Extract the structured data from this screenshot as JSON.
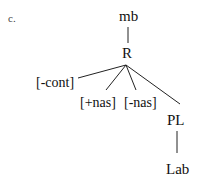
{
  "example_label": "c.",
  "tree": {
    "root": "mb",
    "node": "R",
    "children": [
      "[-cont]",
      "[+nas]",
      "[-nas]",
      "PL"
    ],
    "place_child": "Lab"
  }
}
